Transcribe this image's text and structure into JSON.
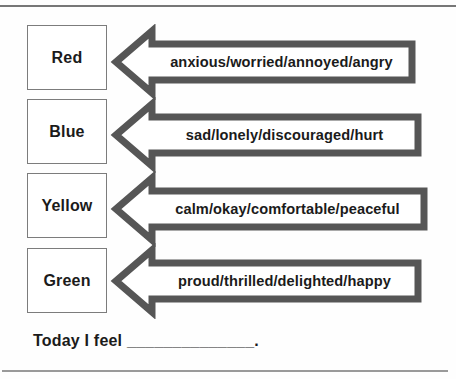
{
  "rows": [
    {
      "color": "Red",
      "feelings": "anxious/worried/annoyed/angry"
    },
    {
      "color": "Blue",
      "feelings": "sad/lonely/discouraged/hurt"
    },
    {
      "color": "Yellow",
      "feelings": "calm/okay/comfortable/peaceful"
    },
    {
      "color": "Green",
      "feelings": "proud/thrilled/delighted/happy"
    }
  ],
  "footer": {
    "prompt": "Today I feel ______________."
  },
  "colors": {
    "arrow_outline": "#565656",
    "arrow_fill": "#ffffff",
    "box_border": "#7c7c7c",
    "rule_top": "#777777",
    "rule_bottom": "#9a9a9a",
    "text": "#1b1b1b"
  }
}
